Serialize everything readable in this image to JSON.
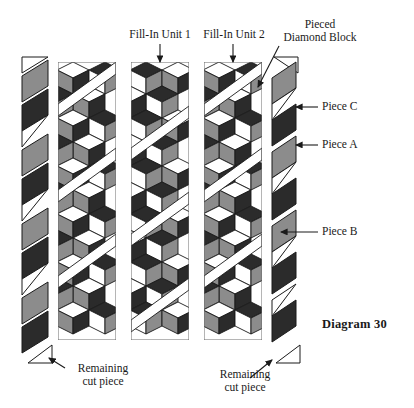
{
  "diagram": {
    "caption": "Diagram 30",
    "background_color": "#ffffff",
    "fabric_colors": {
      "light": "#ffffff",
      "medium_gray": "#8c8c8c",
      "dark": "#2b2b2b",
      "outline": "#1a1a1a"
    }
  },
  "labels": {
    "fill_in_unit_1": "Fill-In Unit 1",
    "fill_in_unit_2": "Fill-In Unit 2",
    "pieced_diamond_block_line1": "Pieced",
    "pieced_diamond_block_line2": "Diamond Block",
    "piece_c": "Piece C",
    "piece_a": "Piece A",
    "piece_b": "Piece B",
    "remaining_cut_piece_left_line1": "Remaining",
    "remaining_cut_piece_left_line2": "cut piece",
    "remaining_cut_piece_right_line1": "Remaining",
    "remaining_cut_piece_right_line2": "cut piece",
    "diagram_number": "Diagram 30"
  },
  "columns": [
    {
      "name": "left-cut-strip",
      "kind": "strip",
      "x": 20,
      "width": 32,
      "top": 55,
      "bottom": 355,
      "sequence": [
        "white-triangle",
        "gray-parallelogram",
        "dark-parallelogram",
        "white-triangle",
        "gray-parallelogram",
        "dark-parallelogram",
        "white-triangle",
        "gray-parallelogram",
        "dark-parallelogram",
        "white-triangle",
        "gray-parallelogram",
        "dark-parallelogram",
        "white-triangle"
      ]
    },
    {
      "name": "pieced-diamond-panel-1",
      "kind": "panel",
      "x": 58,
      "width": 58,
      "top": 62,
      "bottom": 340,
      "rows": 5,
      "has_sashing": true
    },
    {
      "name": "fill-in-unit-1-panel",
      "kind": "panel",
      "x": 131,
      "width": 58,
      "top": 62,
      "bottom": 340,
      "rows": 5,
      "has_sashing": true
    },
    {
      "name": "fill-in-unit-2-panel",
      "kind": "panel",
      "x": 204,
      "width": 58,
      "top": 62,
      "bottom": 340,
      "rows": 5,
      "has_sashing": true
    },
    {
      "name": "right-cut-strip",
      "kind": "strip",
      "x": 270,
      "width": 30,
      "top": 55,
      "bottom": 355,
      "sequence": [
        "white-triangle",
        "gray-parallelogram",
        "white-triangle",
        "dark-parallelogram",
        "gray-parallelogram",
        "white-triangle",
        "dark-parallelogram",
        "gray-parallelogram",
        "white-triangle",
        "dark-parallelogram",
        "white-triangle"
      ]
    }
  ],
  "callouts": [
    {
      "name": "fill-in-unit-1",
      "target": "panel-2-top",
      "arrow": "down"
    },
    {
      "name": "fill-in-unit-2",
      "target": "panel-3-top",
      "arrow": "down"
    },
    {
      "name": "pieced-diamond-block",
      "target": "panel-3-upper-right",
      "arrow": "diagonal-down-right"
    },
    {
      "name": "piece-c",
      "target": "right-strip-dark",
      "arrow": "left"
    },
    {
      "name": "piece-a",
      "target": "right-strip-gray",
      "arrow": "left"
    },
    {
      "name": "piece-b",
      "target": "right-strip-white-triangle",
      "arrow": "left"
    },
    {
      "name": "remaining-cut-piece-left",
      "target": "left-strip-bottom-triangle",
      "arrow": "up-left"
    },
    {
      "name": "remaining-cut-piece-right",
      "target": "right-strip-bottom-triangle",
      "arrow": "up-right"
    }
  ]
}
